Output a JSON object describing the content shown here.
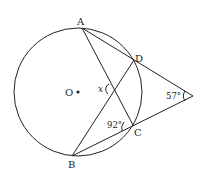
{
  "diagram": {
    "type": "geometry-circle-secants",
    "circle": {
      "center_label": "O",
      "cx": 78,
      "cy": 92,
      "r": 64
    },
    "points": {
      "A": {
        "label": "A",
        "x": 82,
        "y": 28
      },
      "D": {
        "label": "D",
        "x": 134,
        "y": 60
      },
      "C": {
        "label": "C",
        "x": 133,
        "y": 125
      },
      "B": {
        "label": "B",
        "x": 72,
        "y": 156
      },
      "P": {
        "label": "",
        "x": 193,
        "y": 96
      }
    },
    "segments": [
      "A-P",
      "B-P",
      "A-C",
      "B-D"
    ],
    "angles": {
      "external": {
        "label": "57°",
        "vertex": "P"
      },
      "at_C": {
        "label": "92°",
        "vertex": "C"
      },
      "x": {
        "label": "x",
        "vertex": "AC∩BD"
      }
    }
  }
}
